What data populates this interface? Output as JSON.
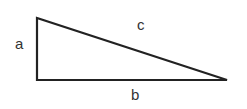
{
  "diagram": {
    "type": "right-triangle",
    "vertices": {
      "top": [
        37,
        18
      ],
      "right_angle": [
        37,
        80
      ],
      "right": [
        227,
        80
      ]
    },
    "labels": {
      "a": "a",
      "b": "b",
      "c": "c"
    },
    "stroke_color": "#222222"
  }
}
